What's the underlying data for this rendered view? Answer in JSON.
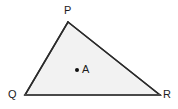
{
  "figure": {
    "name": "triangle-pqr-with-point-a",
    "canvas": {
      "width": 178,
      "height": 109,
      "background": "#ffffff"
    },
    "shape": {
      "type": "triangle",
      "fill": "#f2f2f2",
      "stroke": "#2b2b2b",
      "stroke_width": 1.5,
      "vertices": [
        {
          "id": "P",
          "x": 68,
          "y": 22
        },
        {
          "id": "Q",
          "x": 25,
          "y": 95
        },
        {
          "id": "R",
          "x": 160,
          "y": 95
        }
      ],
      "base_edge": {
        "from": "Q",
        "to": "R",
        "stroke": "#4a4a4a",
        "stroke_width": 2.2
      }
    },
    "interior_point": {
      "id": "A",
      "x": 77,
      "y": 70,
      "radius": 2,
      "color": "#111111"
    },
    "labels": {
      "p": "P",
      "q": "Q",
      "r": "R",
      "a": "A"
    },
    "label_color": "#1c1c1c"
  }
}
